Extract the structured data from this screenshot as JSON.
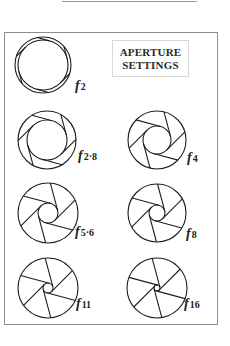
{
  "title": {
    "line1": "APERTURE",
    "line2": "SETTINGS"
  },
  "apertures": [
    {
      "id": "f2",
      "prefix": "f",
      "number": "2",
      "cx": 43,
      "cy": 65,
      "R": 28,
      "r": 25,
      "label_x": 75,
      "label_y": 88
    },
    {
      "id": "f2.8",
      "prefix": "f",
      "number": "2·8",
      "cx": 47,
      "cy": 140,
      "R": 29,
      "r": 20,
      "label_x": 78,
      "label_y": 158
    },
    {
      "id": "f4",
      "prefix": "f",
      "number": "4",
      "cx": 157,
      "cy": 140,
      "R": 29,
      "r": 14,
      "label_x": 187,
      "label_y": 160
    },
    {
      "id": "f5.6",
      "prefix": "f",
      "number": "5·6",
      "cx": 48,
      "cy": 213,
      "R": 30,
      "r": 10,
      "label_x": 75,
      "label_y": 234
    },
    {
      "id": "f8",
      "prefix": "f",
      "number": "8",
      "cx": 157,
      "cy": 213,
      "R": 29,
      "r": 8,
      "label_x": 186,
      "label_y": 236
    },
    {
      "id": "f11",
      "prefix": "f",
      "number": "11",
      "cx": 48,
      "cy": 288,
      "R": 30,
      "r": 5,
      "label_x": 76,
      "label_y": 306
    },
    {
      "id": "f16",
      "prefix": "f",
      "number": "16",
      "cx": 157,
      "cy": 288,
      "R": 30,
      "r": 3,
      "label_x": 184,
      "label_y": 306
    }
  ],
  "colors": {
    "stroke": "#1e1e1e",
    "frame": "#8c8c8c",
    "background": "#ffffff"
  }
}
